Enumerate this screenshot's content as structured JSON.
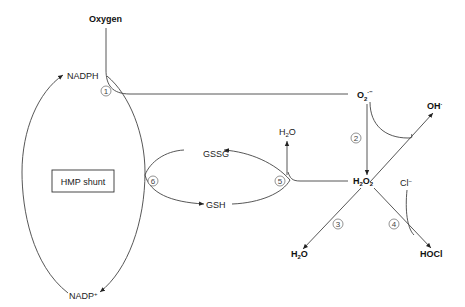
{
  "diagram": {
    "nodes": {
      "oxygen": "Oxygen",
      "nadph": "NADPH",
      "nadp": "NADP",
      "nadp_sup": "+",
      "hmp_shunt": "HMP shunt",
      "gssg": "GSSG",
      "gsh": "GSH",
      "h2o_top_h": "H",
      "h2o_top_2": "2",
      "h2o_top_o": "O",
      "superoxide_o": "O",
      "superoxide_sub": "2",
      "superoxide_sup": "·−",
      "hydroxyl": "OH",
      "hydroxyl_sup": "·",
      "h2o2_h": "H",
      "h2o2_2a": "2",
      "h2o2_o": "O",
      "h2o2_2b": "2",
      "chloride": "Cl",
      "chloride_sup": "−",
      "h2o_bottom_h": "H",
      "h2o_bottom_2": "2",
      "h2o_bottom_o": "O",
      "hocl": "HOCl"
    },
    "steps": [
      "1",
      "2",
      "3",
      "4",
      "5",
      "6"
    ]
  }
}
